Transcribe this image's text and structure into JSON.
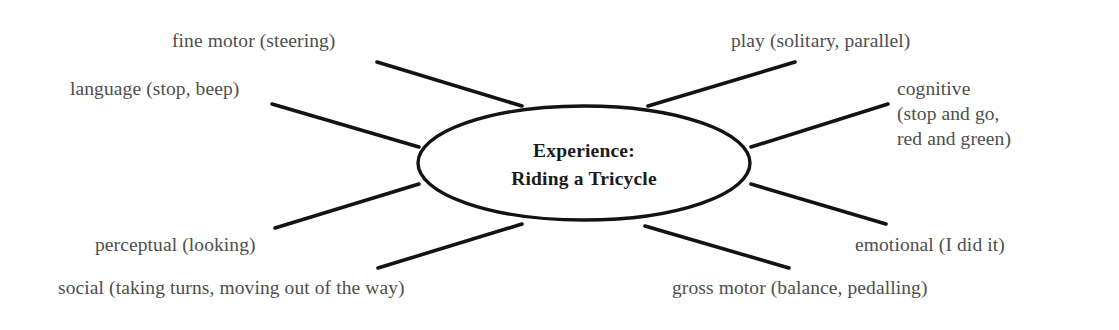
{
  "diagram": {
    "type": "hub-and-spoke mind map",
    "center": {
      "line1": "Experience:",
      "line2": "Riding a Tricycle"
    },
    "colors": {
      "background": "#ffffff",
      "stroke": "#131313",
      "center_text": "#1b1b1b",
      "branch_text": "#4e4e4e"
    },
    "branches": [
      {
        "id": "fine-motor",
        "text": "fine motor (steering)"
      },
      {
        "id": "language",
        "text": "language (stop, beep)"
      },
      {
        "id": "play",
        "text": "play (solitary, parallel)"
      },
      {
        "id": "cognitive",
        "line1": "cognitive",
        "line2": "(stop and go,",
        "line3": "red and green)"
      },
      {
        "id": "perceptual",
        "text": "perceptual (looking)"
      },
      {
        "id": "social",
        "text": "social (taking turns, moving out of the way)"
      },
      {
        "id": "emotional",
        "text": "emotional (I did it)"
      },
      {
        "id": "gross-motor",
        "text": "gross motor (balance, pedalling)"
      }
    ]
  }
}
